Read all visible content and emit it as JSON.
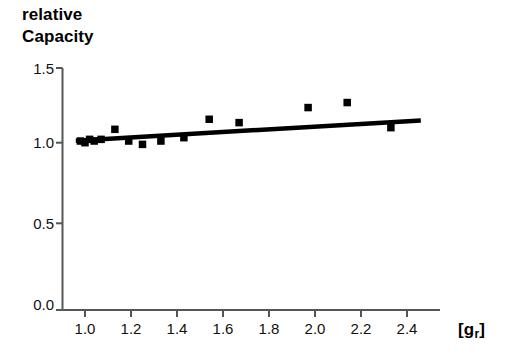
{
  "chart_data": {
    "type": "scatter",
    "title": "",
    "subtitle": "",
    "ylabel": "relative\nCapacity",
    "ylabel_lines": [
      "relative",
      "Capacity"
    ],
    "xlabel": "[gr]",
    "xlabel_base": "[g",
    "xlabel_sub": "r",
    "xlabel_close": "]",
    "xlim": [
      0.93,
      2.48
    ],
    "ylim": [
      0.0,
      1.5
    ],
    "xticks": [
      1.0,
      1.2,
      1.4,
      1.6,
      1.8,
      2.0,
      2.2,
      2.4
    ],
    "xtick_labels": [
      "1.0",
      "1.2",
      "1.4",
      "1.6",
      "1.8",
      "2.0",
      "2.2",
      "2.4"
    ],
    "yticks": [
      0.0,
      0.5,
      1.0,
      1.5
    ],
    "ytick_labels": [
      "0.0",
      "0.5",
      "1.0",
      "1.5"
    ],
    "grid": false,
    "legend": null,
    "marker": "square",
    "marker_color": "#000000",
    "line_color": "#000000",
    "series": [
      {
        "name": "relative capacity data",
        "type": "scatter",
        "x": [
          0.98,
          1.0,
          1.02,
          1.04,
          1.07,
          1.13,
          1.19,
          1.25,
          1.33,
          1.43,
          1.54,
          1.67,
          1.97,
          2.14,
          2.33
        ],
        "y": [
          1.01,
          1.0,
          1.02,
          1.01,
          1.02,
          1.08,
          1.01,
          0.99,
          1.01,
          1.03,
          1.14,
          1.12,
          1.21,
          1.24,
          1.09
        ]
      },
      {
        "name": "regression line",
        "type": "line",
        "x": [
          0.96,
          2.46
        ],
        "y": [
          1.012,
          1.133
        ]
      }
    ]
  },
  "axes": {
    "y_axis_name": "relative-capacity-axis",
    "x_axis_name": "gr-axis"
  }
}
